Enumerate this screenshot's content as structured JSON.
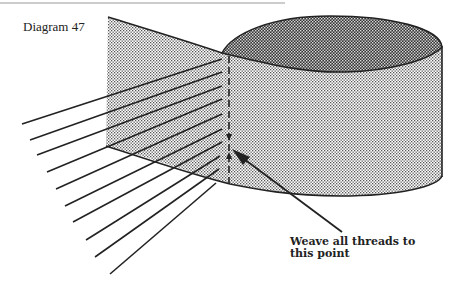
{
  "diagram": {
    "title": "Diagram 47",
    "callout": {
      "line1": "Weave all threads to",
      "line2": "this point"
    },
    "elements": {
      "panel": "flat dotted panel (threads laid across)",
      "cylinder": "cylindrical form with dark-shaded top ellipse",
      "thread_count": 10,
      "dashed_line": "vertical dashed weave line",
      "arrow": "pointer to weave point"
    },
    "colors": {
      "ink": "#222222",
      "background": "#ffffff"
    }
  }
}
